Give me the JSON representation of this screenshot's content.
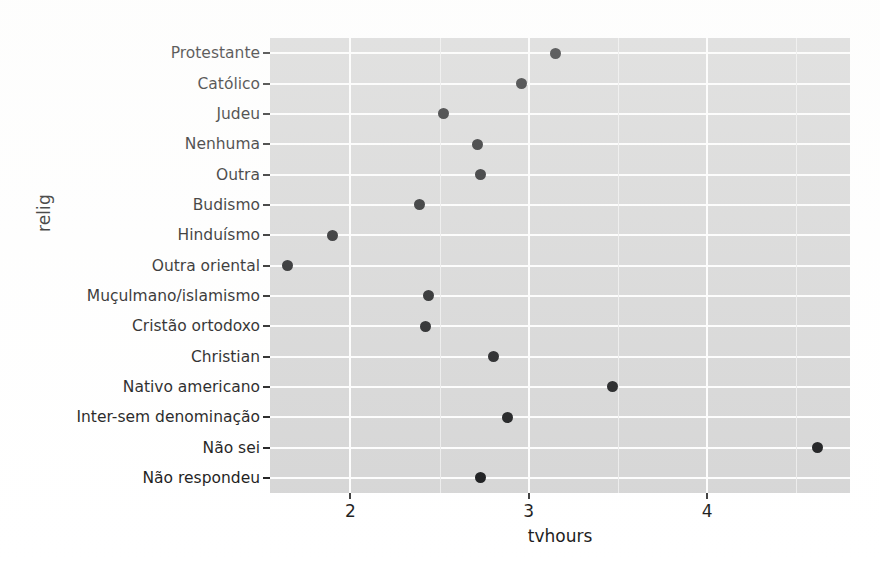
{
  "chart_data": {
    "type": "scatter",
    "title": "",
    "xlabel": "tvhours",
    "ylabel": "relig",
    "xlim": [
      1.55,
      4.8
    ],
    "xticks": [
      2,
      3,
      4
    ],
    "xtick_labels": [
      "2",
      "3",
      "4"
    ],
    "grid": true,
    "legend": "none",
    "orientation": "horizontal-dotplot",
    "categories": [
      "Protestante",
      "Católico",
      "Judeu",
      "Nenhuma",
      "Outra",
      "Budismo",
      "Hinduísmo",
      "Outra oriental",
      "Muçulmano/islamismo",
      "Cristão ortodoxo",
      "Christian",
      "Nativo americano",
      "Inter-sem denominação",
      "Não sei",
      "Não respondeu"
    ],
    "values": [
      3.15,
      2.96,
      2.52,
      2.71,
      2.73,
      2.39,
      1.9,
      1.65,
      2.44,
      2.42,
      2.8,
      3.47,
      2.88,
      4.62,
      2.73
    ],
    "points": [
      {
        "category": "Protestante",
        "value": 3.15
      },
      {
        "category": "Católico",
        "value": 2.96
      },
      {
        "category": "Judeu",
        "value": 2.52
      },
      {
        "category": "Nenhuma",
        "value": 2.71
      },
      {
        "category": "Outra",
        "value": 2.73
      },
      {
        "category": "Budismo",
        "value": 2.39
      },
      {
        "category": "Hinduísmo",
        "value": 1.9
      },
      {
        "category": "Outra oriental",
        "value": 1.65
      },
      {
        "category": "Muçulmano/islamismo",
        "value": 2.44
      },
      {
        "category": "Cristão ortodoxo",
        "value": 2.42
      },
      {
        "category": "Christian",
        "value": 2.8
      },
      {
        "category": "Nativo americano",
        "value": 3.47
      },
      {
        "category": "Inter-sem denominação",
        "value": 2.88
      },
      {
        "category": "Não sei",
        "value": 4.62
      },
      {
        "category": "Não respondeu",
        "value": 2.73
      }
    ],
    "colors": {
      "panel_background": "#d5d5d5",
      "gridline_major": "#fdfdfd",
      "gridline_minor": "#ececec",
      "point": "#17181a",
      "text": "#1a1a1a",
      "page_background": "#ffffff"
    }
  }
}
